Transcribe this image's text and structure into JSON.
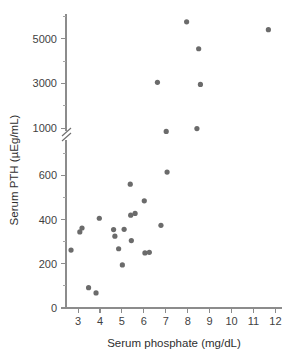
{
  "chart_data": {
    "type": "scatter",
    "title": "",
    "xlabel": "Serum phosphate (mg/dL)",
    "ylabel": "Serum PTH (µEg/mL)",
    "grid": false,
    "legend": null,
    "xlim": [
      2.45,
      12.3
    ],
    "x_ticks": [
      3,
      4,
      5,
      6,
      7,
      8,
      9,
      10,
      11,
      12
    ],
    "x_tick_labels": [
      "3",
      "4",
      "5",
      "6",
      "7",
      "8",
      "9",
      "10",
      "11",
      "12"
    ],
    "y_axis_broken": true,
    "y_break_between": [
      700,
      900
    ],
    "y_ticks_lower": [
      0,
      200,
      400,
      600
    ],
    "y_tick_labels_lower": [
      "0",
      "200",
      "400",
      "600"
    ],
    "y_minor_ticks_lower": [
      100,
      300,
      500,
      700
    ],
    "y_ticks_upper": [
      1000,
      3000,
      5000
    ],
    "y_tick_labels_upper": [
      "1000",
      "3000",
      "5000"
    ],
    "y_minor_ticks_upper": [
      2000,
      4000,
      6000
    ],
    "ylim_lower": [
      0,
      760
    ],
    "ylim_upper": [
      880,
      6100
    ],
    "marker": "filled-circle",
    "marker_color": "#6b6b6b",
    "marker_size": 4,
    "points": [
      {
        "x": 2.68,
        "y": 262
      },
      {
        "x": 3.08,
        "y": 344
      },
      {
        "x": 3.18,
        "y": 362
      },
      {
        "x": 3.48,
        "y": 92
      },
      {
        "x": 3.82,
        "y": 68
      },
      {
        "x": 3.97,
        "y": 406
      },
      {
        "x": 4.62,
        "y": 355
      },
      {
        "x": 4.68,
        "y": 325
      },
      {
        "x": 4.85,
        "y": 268
      },
      {
        "x": 5.02,
        "y": 195
      },
      {
        "x": 5.1,
        "y": 356
      },
      {
        "x": 5.38,
        "y": 560
      },
      {
        "x": 5.4,
        "y": 420
      },
      {
        "x": 5.43,
        "y": 305
      },
      {
        "x": 5.6,
        "y": 428
      },
      {
        "x": 6.02,
        "y": 485
      },
      {
        "x": 6.05,
        "y": 249
      },
      {
        "x": 6.25,
        "y": 252
      },
      {
        "x": 6.62,
        "y": 3050
      },
      {
        "x": 6.78,
        "y": 374
      },
      {
        "x": 7.02,
        "y": 860
      },
      {
        "x": 7.06,
        "y": 615
      },
      {
        "x": 7.95,
        "y": 5750
      },
      {
        "x": 8.42,
        "y": 990
      },
      {
        "x": 8.5,
        "y": 4550
      },
      {
        "x": 8.58,
        "y": 2960
      },
      {
        "x": 11.68,
        "y": 5400
      }
    ]
  }
}
